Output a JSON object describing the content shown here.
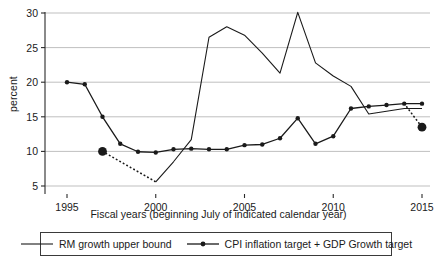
{
  "chart_data": {
    "type": "line",
    "title": "",
    "xlabel": "Fiscal years (beginning July of indicated calendar year)",
    "ylabel": "percent",
    "xlim": [
      1994,
      2015.6
    ],
    "ylim": [
      4.2,
      30.8
    ],
    "yticks": [
      5,
      10,
      15,
      20,
      25,
      30
    ],
    "xticks": [
      1995,
      2000,
      2005,
      2010,
      2015
    ],
    "xticklabels": [
      "1995",
      "2000",
      "2005",
      "2010",
      "2015"
    ],
    "yticklabels": [
      "5",
      "10",
      "15",
      "20",
      "25",
      "30"
    ],
    "grid": "horizontal",
    "legend_position": "below-axes",
    "series": [
      {
        "name": "RM growth upper bound",
        "style": "solid",
        "marker": "none",
        "color": "#1a1a1a",
        "x": [
          2000,
          2001,
          2002,
          2003,
          2004,
          2005,
          2006,
          2007,
          2008,
          2009,
          2010,
          2011,
          2012,
          2013,
          2014,
          2015
        ],
        "values": [
          5.6,
          8.5,
          11.7,
          26.5,
          28.0,
          26.8,
          24.2,
          21.3,
          30.1,
          22.8,
          20.9,
          19.4,
          15.4,
          15.8,
          16.2,
          16.2
        ]
      },
      {
        "name": "CPI inflation target + GDP Growth target",
        "style": "solid",
        "marker": "circle",
        "color": "#1a1a1a",
        "x": [
          1995,
          1996,
          1997,
          1998,
          1999,
          2000,
          2001,
          2002,
          2003,
          2004,
          2005,
          2006,
          2007,
          2008,
          2009,
          2010,
          2011,
          2012,
          2013,
          2014,
          2015
        ],
        "values": [
          20.0,
          19.7,
          15.0,
          11.1,
          9.95,
          9.85,
          10.3,
          10.4,
          10.3,
          10.3,
          10.9,
          11.0,
          11.9,
          14.8,
          11.1,
          12.2,
          16.2,
          16.5,
          16.7,
          16.9,
          16.9
        ]
      }
    ],
    "dotted_segments": [
      {
        "name": "1997-2000 target transition",
        "from": {
          "x": 1997,
          "y": 10.0
        },
        "to": {
          "x": 2000,
          "y": 5.6
        },
        "endpoint_markers": [
          "large-dot",
          "none"
        ]
      },
      {
        "name": "2014-2015 target transition",
        "from": {
          "x": 2014,
          "y": 16.9
        },
        "to": {
          "x": 2015,
          "y": 13.5
        },
        "endpoint_markers": [
          "none",
          "large-dot"
        ]
      }
    ],
    "emphasis_points": [
      {
        "x": 1997,
        "y": 10.0,
        "label": ""
      },
      {
        "x": 2015,
        "y": 13.5,
        "label": ""
      }
    ]
  },
  "legend": {
    "items": [
      {
        "label": "RM growth upper bound",
        "marker": "line"
      },
      {
        "label": "CPI inflation target + GDP Growth target",
        "marker": "line-dot"
      }
    ]
  }
}
